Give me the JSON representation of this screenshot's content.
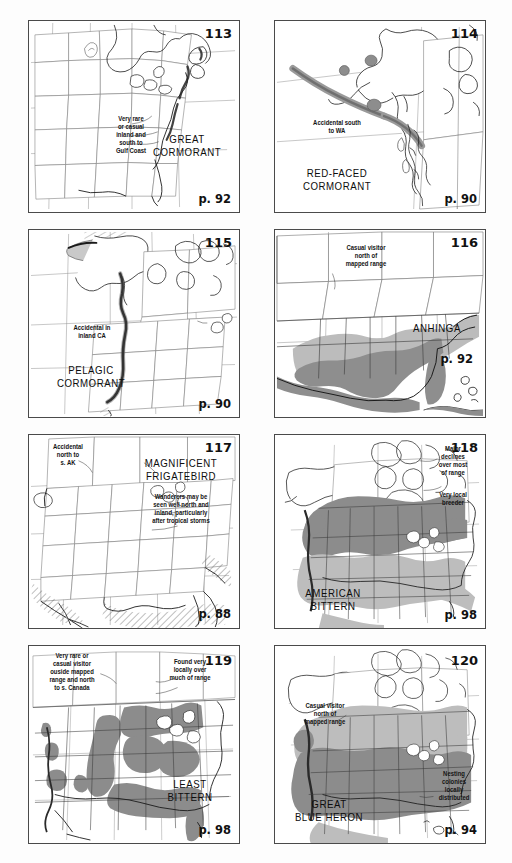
{
  "page": {
    "background_color": "#fdfdfd",
    "panel_border_color": "#4a4a4a",
    "columns": 2,
    "rows": 4
  },
  "legend_colors": {
    "breeding_light_grey": "#b9b9b9",
    "year_round_dark_grey": "#8c8c8c",
    "winter_mid_grey": "#a3a3a3",
    "coastline": "#1a1a1a",
    "state_border": "#6b6b6b",
    "hatch": "#5a5a5a"
  },
  "panels": [
    {
      "number": "113",
      "species": "GREAT\nCORMORANT",
      "page_ref": "p. 92",
      "annotations": [
        "Very rare\nor casual\ninland and\nsouth to\nGulf Coast"
      ],
      "map_extent": "eastern-north-america"
    },
    {
      "number": "114",
      "species": "RED-FACED\nCORMORANT",
      "page_ref": "p. 90",
      "annotations": [
        "Accidental south\nto WA"
      ],
      "map_extent": "alaska-aleutians"
    },
    {
      "number": "115",
      "species": "PELAGIC\nCORMORANT",
      "page_ref": "p. 90",
      "annotations": [
        "Accidental in\ninland CA"
      ],
      "map_extent": "western-north-america"
    },
    {
      "number": "116",
      "species": "ANHINGA",
      "page_ref": "p. 92",
      "annotations": [
        "Casual visitor\nnorth of\nmapped range"
      ],
      "map_extent": "southeastern-us-gulf"
    },
    {
      "number": "117",
      "species": "MAGNIFICENT\nFRIGATEBIRD",
      "page_ref": "p. 88",
      "annotations": [
        "Accidental\nnorth to\ns. AK",
        "Wanderers may be\nseen well north and\ninland, particularly\nafter tropical storms"
      ],
      "map_extent": "conterminous-us-mexico"
    },
    {
      "number": "118",
      "species": "AMERICAN\nBITTERN",
      "page_ref": "p. 98",
      "annotations": [
        "Major\ndeclines\nover most\nof range",
        "Very local\nbreeder"
      ],
      "map_extent": "north-america"
    },
    {
      "number": "119",
      "species": "LEAST\nBITTERN",
      "page_ref": "p. 98",
      "annotations": [
        "Very rare or\ncasual visitor\nouside mapped\nrange and north\nto s. Canada",
        "Found very\nlocally over\nmuch of range"
      ],
      "map_extent": "conterminous-us"
    },
    {
      "number": "120",
      "species": "GREAT\nBLUE HERON",
      "page_ref": "p. 94",
      "annotations": [
        "Casual visitor\nnorth of\nmapped range",
        "Nesting\ncolonies\nlocally\ndistributed"
      ],
      "map_extent": "north-america"
    }
  ]
}
